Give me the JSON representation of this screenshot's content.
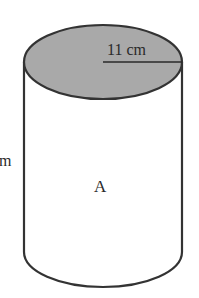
{
  "diagram": {
    "shape": "cylinder",
    "top_fill_color": "#a9a9a9",
    "stroke_color": "#333333",
    "radius_label": "11 cm",
    "height_label_partial": "m",
    "body_label": "A"
  }
}
